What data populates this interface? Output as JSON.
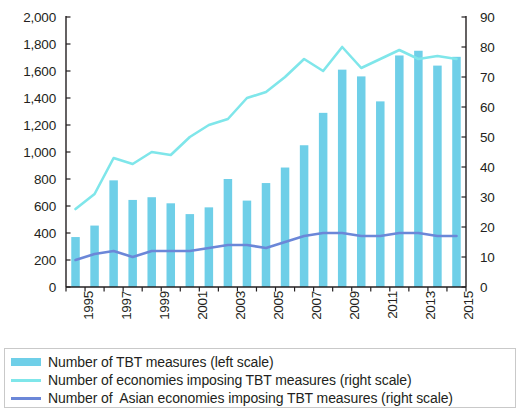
{
  "chart_data": {
    "type": "bar",
    "title": "",
    "subtitle": "",
    "xlabel": "",
    "ylabel": "",
    "grid": false,
    "legend_position": "bottom",
    "x": [
      1995,
      1996,
      1997,
      1998,
      1999,
      2000,
      2001,
      2002,
      2003,
      2004,
      2005,
      2006,
      2007,
      2008,
      2009,
      2010,
      2011,
      2012,
      2013,
      2014,
      2015
    ],
    "categories": [
      "1995",
      "1996",
      "1997",
      "1998",
      "1999",
      "2000",
      "2001",
      "2002",
      "2003",
      "2004",
      "2005",
      "2006",
      "2007",
      "2008",
      "2009",
      "2010",
      "2011",
      "2012",
      "2013",
      "2014",
      "2015"
    ],
    "x_tick_labels": [
      "1995",
      "",
      "1997",
      "",
      "1999",
      "",
      "2001",
      "",
      "2003",
      "",
      "2005",
      "",
      "2007",
      "",
      "2009",
      "",
      "2011",
      "",
      "2013",
      "",
      "2015"
    ],
    "left_axis": {
      "label": "",
      "ticks": [
        "0",
        "200",
        "400",
        "600",
        "800",
        "1,000",
        "1,200",
        "1,400",
        "1,600",
        "1,800",
        "2,000"
      ],
      "tick_values": [
        0,
        200,
        400,
        600,
        800,
        1000,
        1200,
        1400,
        1600,
        1800,
        2000
      ],
      "ylim": [
        0,
        2000
      ]
    },
    "right_axis": {
      "label": "",
      "ticks": [
        "0",
        "10",
        "20",
        "30",
        "40",
        "50",
        "60",
        "70",
        "80",
        "90"
      ],
      "tick_values": [
        0,
        10,
        20,
        30,
        40,
        50,
        60,
        70,
        80,
        90
      ],
      "ylim": [
        0,
        90
      ]
    },
    "series": [
      {
        "name": "Number of TBT measures (left scale)",
        "type": "bar",
        "axis": "left",
        "color": "#6FCFE8",
        "values": [
          370,
          455,
          790,
          645,
          665,
          620,
          540,
          590,
          800,
          640,
          770,
          885,
          1050,
          1290,
          1610,
          1560,
          1375,
          1715,
          1750,
          1640,
          1705
        ]
      },
      {
        "name": "Number of economies imposing TBT measures (right scale)",
        "type": "line",
        "axis": "right",
        "color": "#7FE6EA",
        "values": [
          26,
          31,
          43,
          41,
          45,
          44,
          50,
          54,
          56,
          63,
          65,
          70,
          76,
          72,
          80,
          73,
          76,
          79,
          76,
          77,
          76
        ]
      },
      {
        "name": "Number of  Asian economies imposing TBT measures (right scale)",
        "type": "line",
        "axis": "right",
        "color": "#6B87D8",
        "values": [
          9,
          11,
          12,
          10,
          12,
          12,
          12,
          13,
          14,
          14,
          13,
          15,
          17,
          18,
          18,
          17,
          17,
          18,
          18,
          17,
          17
        ]
      }
    ]
  },
  "legend": {
    "items": [
      {
        "label": "Number of TBT measures (left scale)",
        "marker": "bar-swatch",
        "color": "#6FCFE8"
      },
      {
        "label": "Number of economies imposing TBT measures (right scale)",
        "marker": "line-swatch",
        "color": "#7FE6EA"
      },
      {
        "label": "Number of  Asian economies imposing TBT measures (right scale)",
        "marker": "line-swatch-dark",
        "color": "#6B87D8"
      }
    ]
  }
}
